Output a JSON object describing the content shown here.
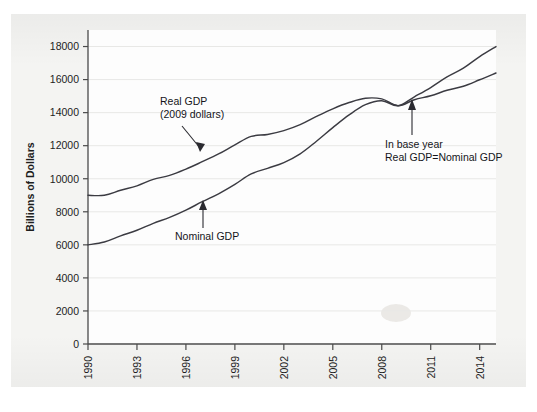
{
  "chart_data": {
    "type": "line",
    "title": "",
    "xlabel": "",
    "ylabel": "Billions of Dollars",
    "xlim": [
      1990,
      2015
    ],
    "ylim": [
      0,
      19000
    ],
    "grid": true,
    "legend_position": "inline-annotations",
    "xticks": [
      "1990",
      "1993",
      "1996",
      "1999",
      "2002",
      "2005",
      "2008",
      "2011",
      "2014"
    ],
    "yticks": [
      "0",
      "2000",
      "4000",
      "6000",
      "8000",
      "10000",
      "12000",
      "14000",
      "16000",
      "18000"
    ],
    "x": [
      1990,
      1991,
      1992,
      1993,
      1994,
      1995,
      1996,
      1997,
      1998,
      1999,
      2000,
      2001,
      2002,
      2003,
      2004,
      2005,
      2006,
      2007,
      2008,
      2009,
      2010,
      2011,
      2012,
      2013,
      2014,
      2015
    ],
    "series": [
      {
        "name": "Real GDP (2009 dollars)",
        "values": [
          9000,
          9000,
          9300,
          9570,
          9960,
          10200,
          10580,
          11030,
          11500,
          12050,
          12560,
          12680,
          12910,
          13270,
          13770,
          14230,
          14610,
          14870,
          14830,
          14420,
          14780,
          15020,
          15350,
          15600,
          15990,
          16400
        ]
      },
      {
        "name": "Nominal GDP",
        "values": [
          6000,
          6170,
          6540,
          6880,
          7300,
          7660,
          8100,
          8610,
          9090,
          9660,
          10290,
          10630,
          10980,
          11510,
          12270,
          13090,
          13860,
          14480,
          14720,
          14420,
          14960,
          15520,
          16160,
          16690,
          17390,
          18000
        ]
      }
    ],
    "annotations": [
      {
        "name": "real-gdp-label",
        "lines": [
          "Real GDP",
          "(2009 dollars)"
        ],
        "points_to": {
          "x": 1996.2,
          "y": 11100
        }
      },
      {
        "name": "nominal-gdp-label",
        "lines": [
          "Nominal GDP"
        ],
        "points_to": {
          "x": 1996.6,
          "y": 8450
        }
      },
      {
        "name": "base-year-label",
        "lines": [
          "In base year",
          "Real GDP=Nominal GDP"
        ],
        "points_to": {
          "x": 2009,
          "y": 14420
        }
      }
    ]
  }
}
